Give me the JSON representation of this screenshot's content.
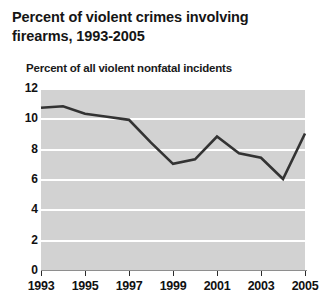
{
  "title": {
    "line1": "Percent of violent crimes involving",
    "line2": "firearms, 1993-2005"
  },
  "subtitle": "Percent of all violent nonfatal incidents",
  "colors": {
    "plot_background": "#d2d2d2",
    "gridline": "#ffffff",
    "line": "#333333",
    "text": "#111111",
    "page_background": "#ffffff"
  },
  "chart_data": {
    "type": "line",
    "title": "Percent of violent crimes involving firearms, 1993-2005",
    "subtitle": "Percent of all violent nonfatal incidents",
    "xlabel": "",
    "ylabel": "Percent of all violent nonfatal incidents",
    "x": [
      1993,
      1994,
      1995,
      1996,
      1997,
      1998,
      1999,
      2000,
      2001,
      2002,
      2003,
      2004,
      2005
    ],
    "values": [
      10.7,
      10.8,
      10.3,
      10.1,
      9.9,
      8.4,
      7.0,
      7.3,
      8.8,
      7.7,
      7.4,
      6.0,
      9.0
    ],
    "series": [
      {
        "name": "Percent of all violent nonfatal incidents",
        "values": [
          10.7,
          10.8,
          10.3,
          10.1,
          9.9,
          8.4,
          7.0,
          7.3,
          8.8,
          7.7,
          7.4,
          6.0,
          9.0
        ]
      }
    ],
    "xlim": [
      1993,
      2005
    ],
    "ylim": [
      0,
      12
    ],
    "yticks": [
      0,
      2,
      4,
      6,
      8,
      10,
      12
    ],
    "ytick_labels": [
      "0",
      "2",
      "4",
      "6",
      "8",
      "10",
      "12"
    ],
    "xticks": [
      1993,
      1995,
      1997,
      1999,
      2001,
      2003,
      2005
    ],
    "xtick_labels": [
      "1993",
      "1995",
      "1997",
      "1999",
      "2001",
      "2003",
      "2005"
    ],
    "grid": "horizontal",
    "legend": "none",
    "markers": false
  }
}
